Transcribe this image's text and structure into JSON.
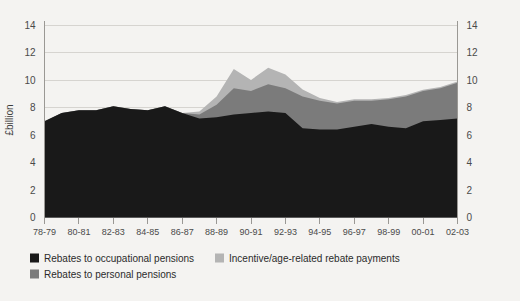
{
  "chart_data": {
    "type": "area",
    "stacked": true,
    "title": "",
    "xlabel": "",
    "ylabel": "£billion",
    "ylim": [
      0,
      14
    ],
    "yticks": [
      0,
      2,
      4,
      6,
      8,
      10,
      12,
      14
    ],
    "ytick_labels": [
      "0",
      "2",
      "4",
      "6",
      "8",
      "10",
      "12",
      "14"
    ],
    "right_axis": true,
    "right_ytick_labels": [
      "0",
      "2",
      "4",
      "6",
      "8",
      "10",
      "12",
      "14"
    ],
    "grid": true,
    "legend_position": "bottom-left",
    "x": [
      "78-79",
      "79-80",
      "80-81",
      "81-82",
      "82-83",
      "83-84",
      "84-85",
      "85-86",
      "86-87",
      "87-88",
      "88-89",
      "89-90",
      "90-91",
      "91-92",
      "92-93",
      "93-94",
      "94-95",
      "95-96",
      "96-97",
      "97-98",
      "98-99",
      "99-00",
      "00-01",
      "01-02",
      "02-03"
    ],
    "xtick_labels": [
      "78-79",
      "80-81",
      "82-83",
      "84-85",
      "86-87",
      "88-89",
      "90-91",
      "92-93",
      "94-95",
      "96-97",
      "98-99",
      "00-01",
      "02-03"
    ],
    "series": [
      {
        "name": "Rebates to occupational pensions",
        "color": "#191919",
        "values": [
          7.0,
          7.6,
          7.8,
          7.8,
          8.1,
          7.9,
          7.8,
          8.1,
          7.6,
          7.2,
          7.3,
          7.5,
          7.6,
          7.7,
          7.6,
          6.5,
          6.4,
          6.4,
          6.6,
          6.8,
          6.6,
          6.5,
          7.0,
          7.1,
          7.2
        ]
      },
      {
        "name": "Rebates to personal pensions",
        "color": "#7b7b7b",
        "values": [
          0.0,
          0.0,
          0.0,
          0.0,
          0.0,
          0.0,
          0.0,
          0.0,
          0.0,
          0.3,
          0.9,
          1.9,
          1.6,
          2.0,
          1.8,
          2.3,
          2.1,
          1.9,
          1.9,
          1.7,
          2.0,
          2.3,
          2.2,
          2.3,
          2.6
        ]
      },
      {
        "name": "Incentive/age-related rebate payments",
        "color": "#b4b4b4",
        "values": [
          0.0,
          0.0,
          0.0,
          0.0,
          0.0,
          0.0,
          0.0,
          0.0,
          0.0,
          0.2,
          0.6,
          1.4,
          0.8,
          1.2,
          1.0,
          0.5,
          0.2,
          0.1,
          0.1,
          0.1,
          0.1,
          0.1,
          0.1,
          0.1,
          0.1
        ]
      }
    ]
  },
  "legend": {
    "items": [
      {
        "label": "Rebates to occupational pensions",
        "color": "#191919"
      },
      {
        "label": "Incentive/age-related rebate payments",
        "color": "#b4b4b4"
      },
      {
        "label": "Rebates to personal pensions",
        "color": "#7b7b7b"
      }
    ]
  }
}
